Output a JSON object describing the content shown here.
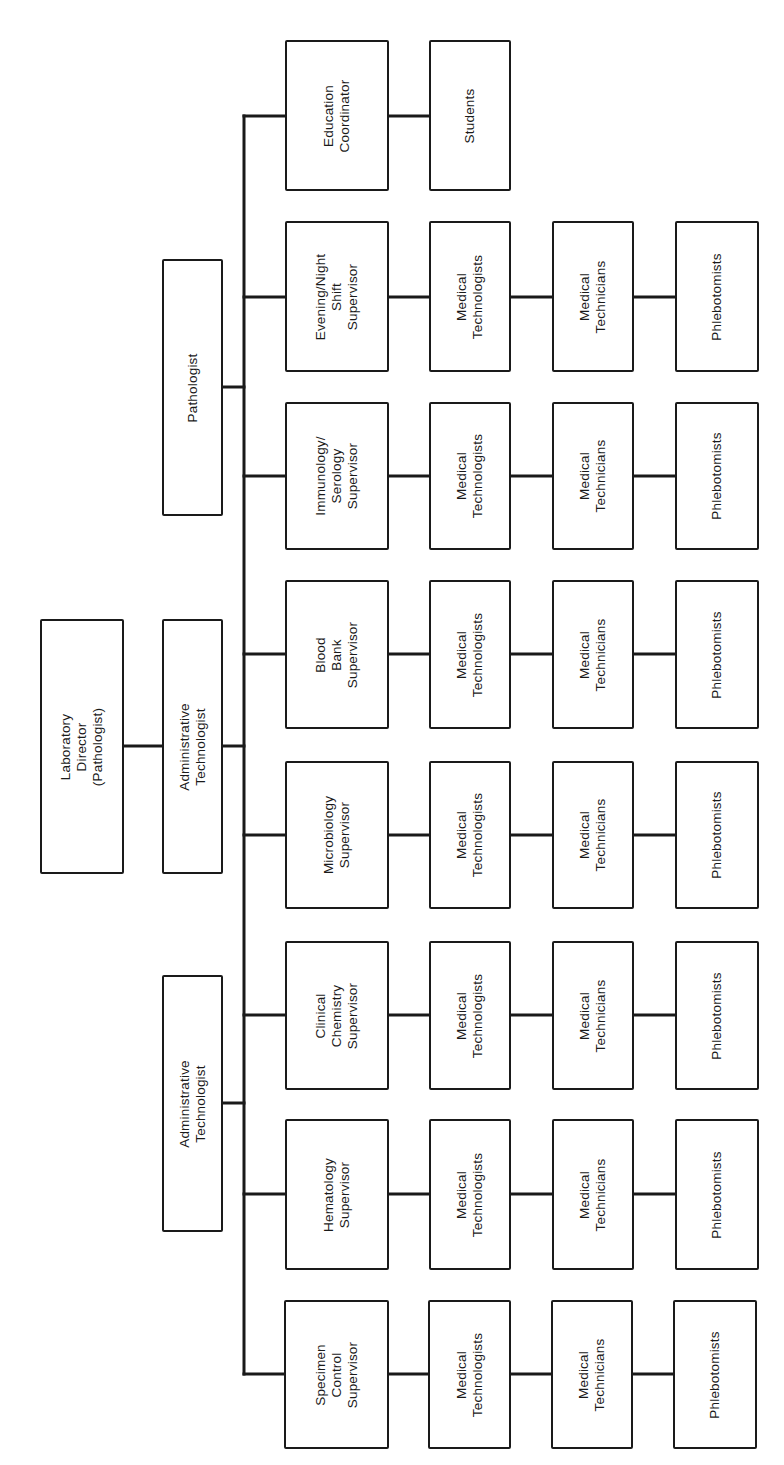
{
  "diagram": {
    "type": "org-chart",
    "orientation": "rotated-90-ccw",
    "line_color": "#1a1a1a",
    "top": {
      "director": {
        "label": "Laboratory Director\n(Pathologist)"
      },
      "admin_technologist_1": {
        "label": "Administrative Technologist"
      },
      "admin_technologist_2": {
        "label": "Administrative Technologist"
      },
      "pathologist": {
        "label": "Pathologist"
      }
    },
    "rows": [
      {
        "id": "education",
        "supervisor": "Education\nCoordinator",
        "staff": [
          "Students"
        ]
      },
      {
        "id": "evening-night",
        "supervisor": "Evening/Night\nShift\nSupervisor",
        "staff": [
          "Medical\nTechnologists",
          "Medical\nTechnicians",
          "Phlebotomists"
        ]
      },
      {
        "id": "immunology-serology",
        "supervisor": "Immunology/\nSerology\nSupervisor",
        "staff": [
          "Medical\nTechnologists",
          "Medical\nTechnicians",
          "Phlebotomists"
        ]
      },
      {
        "id": "blood-bank",
        "supervisor": "Blood Bank\nSupervisor",
        "staff": [
          "Medical\nTechnologists",
          "Medical\nTechnicians",
          "Phlebotomists"
        ]
      },
      {
        "id": "microbiology",
        "supervisor": "Microbiology\nSupervisor",
        "staff": [
          "Medical\nTechnologists",
          "Medical\nTechnicians",
          "Phlebotomists"
        ]
      },
      {
        "id": "clinical-chemistry",
        "supervisor": "Clinical\nChemistry\nSupervisor",
        "staff": [
          "Medical\nTechnologists",
          "Medical\nTechnicians",
          "Phlebotomists"
        ]
      },
      {
        "id": "hematology",
        "supervisor": "Hematology\nSupervisor",
        "staff": [
          "Medical\nTechnologists",
          "Medical\nTechnicians",
          "Phlebotomists"
        ]
      },
      {
        "id": "specimen-control",
        "supervisor": "Specimen\nControl\nSupervisor",
        "staff": [
          "Medical\nTechnologists",
          "Medical\nTechnicians",
          "Phlebotomists"
        ]
      }
    ]
  }
}
